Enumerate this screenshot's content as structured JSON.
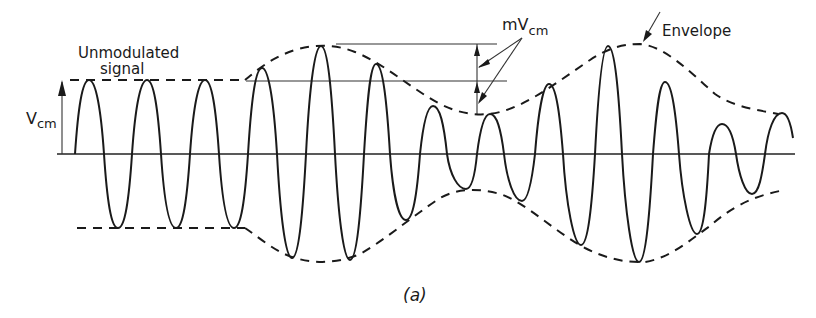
{
  "figure": {
    "caption": "(a)"
  },
  "labels": {
    "unmodulated_line1": "Unmodulated",
    "unmodulated_line2": "signal",
    "vcm_main": "V",
    "vcm_sub": "cm",
    "mvcm_main": "mV",
    "mvcm_sub": "cm",
    "envelope": "Envelope"
  },
  "colors": {
    "ink": "#1a1a1a",
    "background": "#ffffff"
  },
  "geometry": {
    "axis_y": 154,
    "axis_x_start": 57,
    "axis_x_end": 795,
    "unmodulated_amplitude_top_y": 80,
    "unmodulated_amplitude_bottom_y": 228,
    "peaks": [
      [
        89,
        80
      ],
      [
        147,
        80
      ],
      [
        205,
        80
      ],
      [
        262,
        68
      ],
      [
        321,
        46
      ],
      [
        376,
        64
      ],
      [
        433,
        106
      ],
      [
        490,
        114
      ],
      [
        549,
        84
      ],
      [
        608,
        46
      ],
      [
        665,
        82
      ],
      [
        722,
        124
      ],
      [
        782,
        113
      ]
    ],
    "troughs": [
      [
        118,
        228
      ],
      [
        176,
        228
      ],
      [
        234,
        228
      ],
      [
        292,
        258
      ],
      [
        350,
        260
      ],
      [
        406,
        220
      ],
      [
        466,
        189
      ],
      [
        522,
        201
      ],
      [
        581,
        245
      ],
      [
        639,
        262
      ],
      [
        697,
        234
      ],
      [
        752,
        194
      ]
    ]
  }
}
